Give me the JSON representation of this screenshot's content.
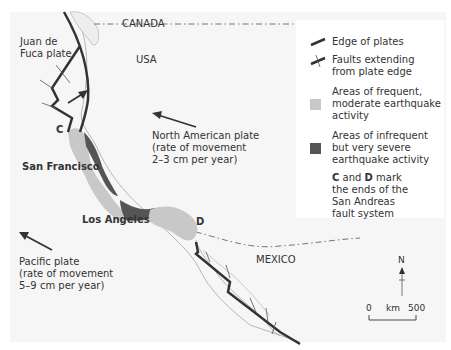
{
  "map": {
    "labels": {
      "canada": "CANADA",
      "usa": "USA",
      "mexico": "MEXICO",
      "juan_de_fuca_1": "Juan de",
      "juan_de_fuca_2": "Fuca plate",
      "north_american_1": "North American plate",
      "north_american_2": "(rate of movement",
      "north_american_3": "2–3 cm per year)",
      "pacific_1": "Pacific plate",
      "pacific_2": "(rate of movement",
      "pacific_3": "5–9 cm per year)",
      "san_francisco": "San Francisco",
      "los_angeles": "Los Angeles",
      "point_c": "C",
      "point_d": "D"
    },
    "legend": {
      "edge_of_plates": "Edge of plates",
      "faults": "Faults extending\nfrom plate edge",
      "frequent": "Areas of frequent,\nmoderate earthquake\nactivity",
      "infrequent": "Areas of infrequent\nbut very severe\nearthquake activity",
      "cd_bold_c": "C",
      "cd_and": " and ",
      "cd_bold_d": "D",
      "cd_rest_1": " mark",
      "cd_rest_2": "the ends of the\nSan Andreas\nfault system"
    },
    "compass": {
      "north": "N"
    },
    "scale": {
      "zero": "0",
      "unit": "km",
      "max": "500"
    },
    "colors": {
      "plate_edge": "#333333",
      "frequent_area": "#c8c8c8",
      "infrequent_area": "#555555",
      "land": "#f7f7f7",
      "border": "#777777"
    }
  }
}
